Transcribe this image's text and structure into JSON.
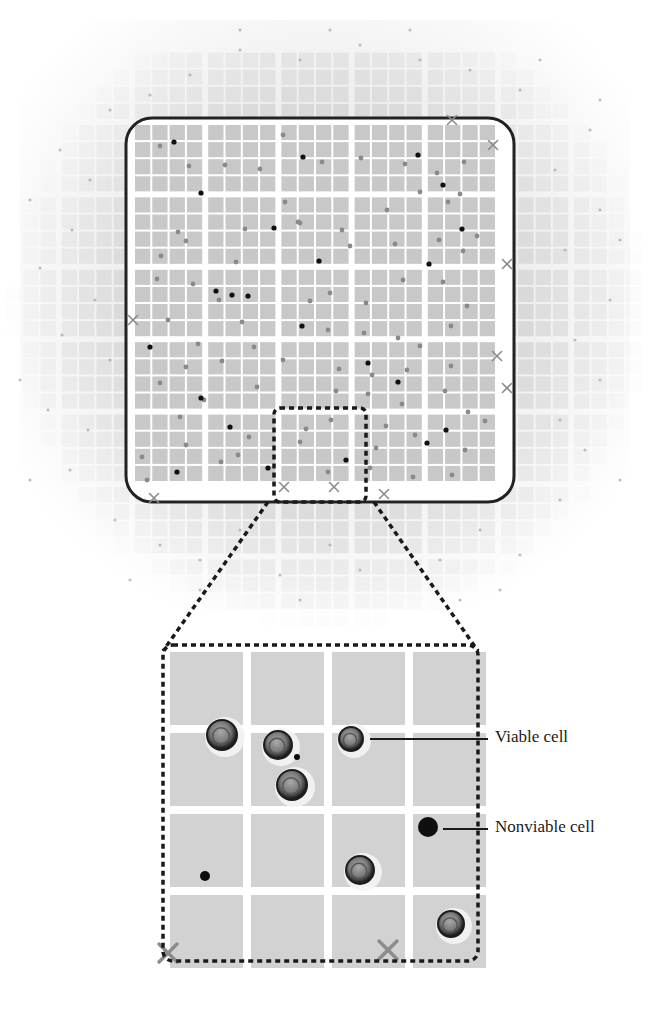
{
  "figure": {
    "labels": {
      "viable": "Viable cell",
      "nonviable": "Nonviable cell"
    },
    "colors": {
      "background": "#ffffff",
      "square_fill": "#c8c8c8",
      "grid_line": "#ffffff",
      "border": "#222222",
      "dashed": "#1a1a1a",
      "viable_dot": "#8a8a8a",
      "nonviable_dot": "#111111",
      "x_mark": "#8c8c8c",
      "halo": "#bdbdbd"
    }
  },
  "overview": {
    "frame": {
      "x": 126,
      "y": 118,
      "w": 388,
      "h": 384,
      "radius": 26
    },
    "grid": {
      "x0": 134,
      "y0": 124,
      "blocks_x": 5,
      "blocks_y": 5,
      "sub": 4,
      "block_w": 73.2,
      "block_h": 72.4,
      "gap": 4
    },
    "nonviable_dots": [
      [
        174,
        142
      ],
      [
        303,
        157
      ],
      [
        418,
        155
      ],
      [
        443,
        185
      ],
      [
        201,
        193
      ],
      [
        274,
        228
      ],
      [
        462,
        229
      ],
      [
        319,
        261
      ],
      [
        429,
        264
      ],
      [
        216,
        291
      ],
      [
        248,
        296
      ],
      [
        302,
        326
      ],
      [
        150,
        347
      ],
      [
        368,
        363
      ],
      [
        398,
        382
      ],
      [
        201,
        398
      ],
      [
        230,
        427
      ],
      [
        446,
        430
      ],
      [
        177,
        472
      ],
      [
        268,
        468
      ],
      [
        346,
        460
      ],
      [
        427,
        443
      ],
      [
        232,
        295
      ]
    ],
    "viable_dots": [
      [
        160,
        146
      ],
      [
        189,
        166
      ],
      [
        225,
        165
      ],
      [
        260,
        169
      ],
      [
        283,
        135
      ],
      [
        322,
        162
      ],
      [
        361,
        158
      ],
      [
        405,
        164
      ],
      [
        437,
        173
      ],
      [
        464,
        162
      ],
      [
        460,
        194
      ],
      [
        178,
        232
      ],
      [
        245,
        229
      ],
      [
        285,
        202
      ],
      [
        300,
        223
      ],
      [
        342,
        230
      ],
      [
        387,
        210
      ],
      [
        420,
        192
      ],
      [
        448,
        202
      ],
      [
        477,
        236
      ],
      [
        161,
        256
      ],
      [
        186,
        241
      ],
      [
        236,
        262
      ],
      [
        298,
        222
      ],
      [
        350,
        246
      ],
      [
        395,
        244
      ],
      [
        439,
        240
      ],
      [
        463,
        251
      ],
      [
        157,
        279
      ],
      [
        193,
        284
      ],
      [
        219,
        300
      ],
      [
        242,
        322
      ],
      [
        310,
        301
      ],
      [
        330,
        293
      ],
      [
        366,
        303
      ],
      [
        403,
        280
      ],
      [
        443,
        282
      ],
      [
        467,
        306
      ],
      [
        168,
        320
      ],
      [
        198,
        344
      ],
      [
        254,
        347
      ],
      [
        328,
        330
      ],
      [
        364,
        333
      ],
      [
        398,
        338
      ],
      [
        420,
        346
      ],
      [
        451,
        326
      ],
      [
        186,
        367
      ],
      [
        222,
        361
      ],
      [
        283,
        360
      ],
      [
        339,
        369
      ],
      [
        372,
        375
      ],
      [
        407,
        370
      ],
      [
        451,
        366
      ],
      [
        160,
        383
      ],
      [
        204,
        400
      ],
      [
        257,
        387
      ],
      [
        336,
        391
      ],
      [
        368,
        394
      ],
      [
        402,
        404
      ],
      [
        445,
        391
      ],
      [
        485,
        421
      ],
      [
        180,
        417
      ],
      [
        249,
        437
      ],
      [
        306,
        429
      ],
      [
        331,
        420
      ],
      [
        386,
        426
      ],
      [
        468,
        412
      ],
      [
        142,
        457
      ],
      [
        186,
        445
      ],
      [
        238,
        455
      ],
      [
        300,
        442
      ],
      [
        376,
        448
      ],
      [
        415,
        435
      ],
      [
        465,
        450
      ],
      [
        147,
        480
      ],
      [
        221,
        462
      ],
      [
        328,
        472
      ],
      [
        370,
        468
      ],
      [
        413,
        477
      ],
      [
        452,
        475
      ]
    ],
    "x_marks": [
      [
        452,
        120
      ],
      [
        493,
        145
      ],
      [
        507,
        264
      ],
      [
        133,
        320
      ],
      [
        497,
        356
      ],
      [
        507,
        388
      ],
      [
        154,
        498
      ],
      [
        284,
        487
      ],
      [
        334,
        487
      ],
      [
        384,
        494
      ]
    ],
    "outer_dots": [
      [
        60,
        150
      ],
      [
        90,
        180
      ],
      [
        72,
        230
      ],
      [
        40,
        268
      ],
      [
        95,
        300
      ],
      [
        62,
        335
      ],
      [
        110,
        360
      ],
      [
        48,
        410
      ],
      [
        88,
        430
      ],
      [
        70,
        470
      ],
      [
        115,
        520
      ],
      [
        160,
        545
      ],
      [
        200,
        560
      ],
      [
        240,
        530
      ],
      [
        280,
        575
      ],
      [
        330,
        545
      ],
      [
        360,
        570
      ],
      [
        400,
        540
      ],
      [
        440,
        560
      ],
      [
        480,
        530
      ],
      [
        520,
        555
      ],
      [
        560,
        500
      ],
      [
        585,
        450
      ],
      [
        560,
        420
      ],
      [
        600,
        380
      ],
      [
        575,
        340
      ],
      [
        610,
        300
      ],
      [
        565,
        250
      ],
      [
        600,
        210
      ],
      [
        555,
        170
      ],
      [
        590,
        130
      ],
      [
        520,
        90
      ],
      [
        470,
        70
      ],
      [
        420,
        60
      ],
      [
        360,
        45
      ],
      [
        300,
        60
      ],
      [
        240,
        50
      ],
      [
        190,
        75
      ],
      [
        150,
        95
      ],
      [
        110,
        110
      ],
      [
        240,
        30
      ],
      [
        330,
        30
      ],
      [
        410,
        30
      ],
      [
        540,
        60
      ],
      [
        600,
        100
      ],
      [
        30,
        200
      ],
      [
        20,
        380
      ],
      [
        30,
        480
      ],
      [
        620,
        480
      ],
      [
        620,
        240
      ],
      [
        130,
        580
      ],
      [
        500,
        590
      ],
      [
        460,
        600
      ],
      [
        300,
        600
      ],
      [
        200,
        590
      ]
    ]
  },
  "zoom_region": {
    "x": 274,
    "y": 408,
    "w": 92,
    "h": 94
  },
  "detail": {
    "frame": {
      "x": 163,
      "y": 645,
      "w": 315,
      "h": 316
    },
    "grid": {
      "x0": 170,
      "y0": 652,
      "cells": 4,
      "cell": 73,
      "gap": 8
    },
    "viable_cells": [
      [
        222,
        735,
        15
      ],
      [
        278,
        745,
        14
      ],
      [
        292,
        785,
        15
      ],
      [
        351,
        739,
        12
      ],
      [
        360,
        870,
        14
      ],
      [
        451,
        924,
        13
      ]
    ],
    "nonviable_cells": [
      [
        428,
        827,
        10
      ],
      [
        297,
        757,
        3
      ],
      [
        205,
        876,
        5
      ]
    ],
    "x_marks": [
      [
        168,
        953
      ],
      [
        388,
        950
      ]
    ],
    "callouts": {
      "viable": {
        "x1": 370,
        "y1": 739,
        "x2": 488,
        "y2": 739,
        "label_x": 495,
        "label_y": 727
      },
      "nonviable": {
        "x1": 443,
        "y1": 829,
        "x2": 488,
        "y2": 829,
        "label_x": 495,
        "label_y": 817
      }
    }
  }
}
